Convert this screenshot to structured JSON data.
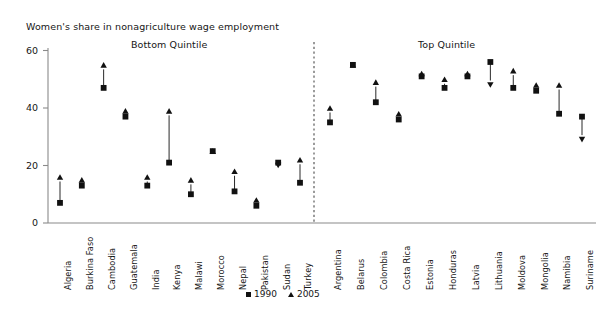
{
  "chart_data": {
    "type": "scatter",
    "title": "Women's share in nonagriculture wage employment",
    "subtitle": "",
    "xlabel": "",
    "ylabel": "",
    "ylim": [
      0,
      60
    ],
    "yticks": [
      0,
      20,
      40,
      60
    ],
    "grid": false,
    "legend_position": "bottom-center",
    "legend": [
      {
        "label": "1990",
        "marker": "square"
      },
      {
        "label": "2005",
        "marker": "triangle"
      }
    ],
    "panels": [
      {
        "name": "Bottom Quintile",
        "categories": [
          "Algeria",
          "Burkina Faso",
          "Cambodia",
          "Guatemala",
          "India",
          "Kenya",
          "Malawi",
          "Morocco",
          "Nepal",
          "Pakistan",
          "Sudan",
          "Turkey"
        ],
        "series": [
          {
            "name": "1990",
            "values": [
              7,
              13,
              47,
              37,
              13,
              21,
              10,
              25,
              11,
              6,
              21,
              14
            ]
          },
          {
            "name": "2005",
            "values": [
              16,
              15,
              55,
              39,
              16,
              39,
              15,
              25,
              18,
              8,
              20,
              22
            ]
          }
        ]
      },
      {
        "name": "Top Quintile",
        "categories": [
          "Argentina",
          "Belarus",
          "Colombia",
          "Costa Rica",
          "Estonia",
          "Honduras",
          "Latvia",
          "Lithuania",
          "Moldova",
          "Mongolia",
          "Namibia",
          "Suriname"
        ],
        "series": [
          {
            "name": "1990",
            "values": [
              35,
              55,
              42,
              36,
              51,
              47,
              51,
              56,
              47,
              46,
              38,
              37
            ]
          },
          {
            "name": "2005",
            "values": [
              40,
              55,
              49,
              38,
              52,
              50,
              52,
              48,
              53,
              48,
              48,
              29
            ]
          }
        ]
      }
    ]
  },
  "axis": {
    "ytick_labels": [
      "60",
      "40",
      "20",
      "0"
    ]
  },
  "colors": {
    "marker": "#111111",
    "axis": "#8a8a8a",
    "divider": "#555555",
    "text": "#161616"
  }
}
